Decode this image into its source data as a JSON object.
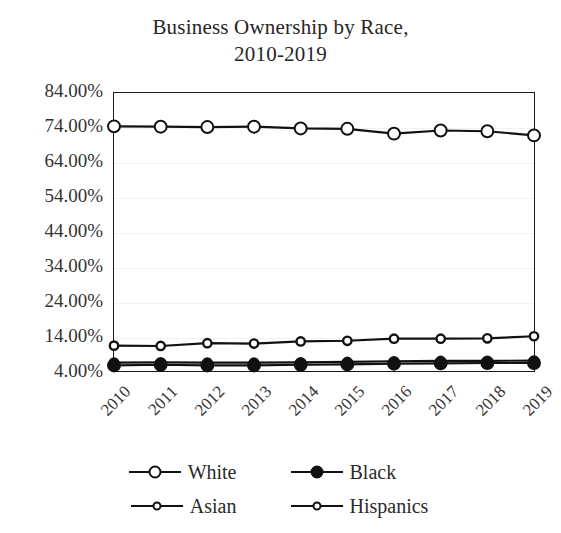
{
  "chart_data": {
    "type": "line",
    "title": "Business Ownership by Race, 2010-2019",
    "title_lines": [
      "Business Ownership by Race,",
      "2010-2019"
    ],
    "xlabel": "",
    "ylabel": "",
    "x": [
      "2010",
      "2011",
      "2012",
      "2013",
      "2014",
      "2015",
      "2016",
      "2017",
      "2018",
      "2019"
    ],
    "categories": [
      "2010",
      "2011",
      "2012",
      "2013",
      "2014",
      "2015",
      "2016",
      "2017",
      "2018",
      "2019"
    ],
    "ylim": [
      4,
      84
    ],
    "ytick_labels": [
      "84.00%",
      "74.00%",
      "64.00%",
      "54.00%",
      "44.00%",
      "34.00%",
      "24.00%",
      "14.00%",
      "4.00%"
    ],
    "ytick_values": [
      84,
      74,
      64,
      54,
      44,
      34,
      24,
      14,
      4
    ],
    "grid": true,
    "legend_position": "bottom",
    "series": [
      {
        "name": "White",
        "marker": "open-circle-large",
        "color": "#111111",
        "values": [
          74.4,
          74.3,
          74.2,
          74.3,
          73.8,
          73.7,
          72.3,
          73.2,
          73.0,
          71.8
        ]
      },
      {
        "name": "Black",
        "marker": "filled-circle",
        "color": "#111111",
        "values": [
          5.6,
          5.8,
          5.6,
          5.6,
          5.8,
          5.9,
          6.1,
          6.2,
          6.3,
          6.3
        ]
      },
      {
        "name": "Asian",
        "marker": "open-circle-small",
        "color": "#111111",
        "values": [
          11.3,
          11.2,
          12.0,
          11.9,
          12.5,
          12.7,
          13.3,
          13.3,
          13.4,
          14.0
        ]
      },
      {
        "name": "Hispanics",
        "marker": "open-circle-small",
        "color": "#111111",
        "values": [
          6.4,
          6.5,
          6.4,
          6.4,
          6.5,
          6.6,
          6.8,
          6.9,
          6.9,
          7.0
        ]
      }
    ]
  },
  "legend": {
    "items": [
      {
        "label": "White"
      },
      {
        "label": "Black"
      },
      {
        "label": "Asian"
      },
      {
        "label": "Hispanics"
      }
    ]
  }
}
